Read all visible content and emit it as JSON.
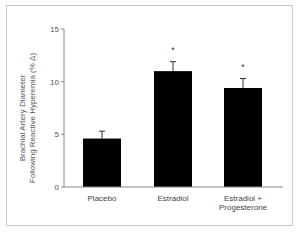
{
  "chart_data": {
    "type": "bar",
    "title": "",
    "xlabel": "",
    "ylabel": "Brachial Artery Diameter Following Reactive Hyperemia (% Δ)",
    "ylabel_lines": [
      "Brachial Artery Diameter",
      "Following Reactive Hyperemia (% Δ)"
    ],
    "ylim": [
      0,
      15
    ],
    "yticks": [
      0,
      5,
      10,
      15
    ],
    "ytick_labels": [
      "0",
      "5",
      "10",
      "15"
    ],
    "grid": false,
    "legend": null,
    "categories": [
      "Placebo",
      "Estradiol",
      "Estradiol + Progesterone"
    ],
    "category_label_lines": [
      [
        "Placebo"
      ],
      [
        "Estradiol"
      ],
      [
        "Estradiol +",
        "Progesterone"
      ]
    ],
    "values": [
      4.6,
      11.0,
      9.4
    ],
    "error_upper": [
      0.7,
      0.9,
      0.9
    ],
    "annotations": [
      "",
      "*",
      "*"
    ],
    "bar_color": "#000000"
  }
}
